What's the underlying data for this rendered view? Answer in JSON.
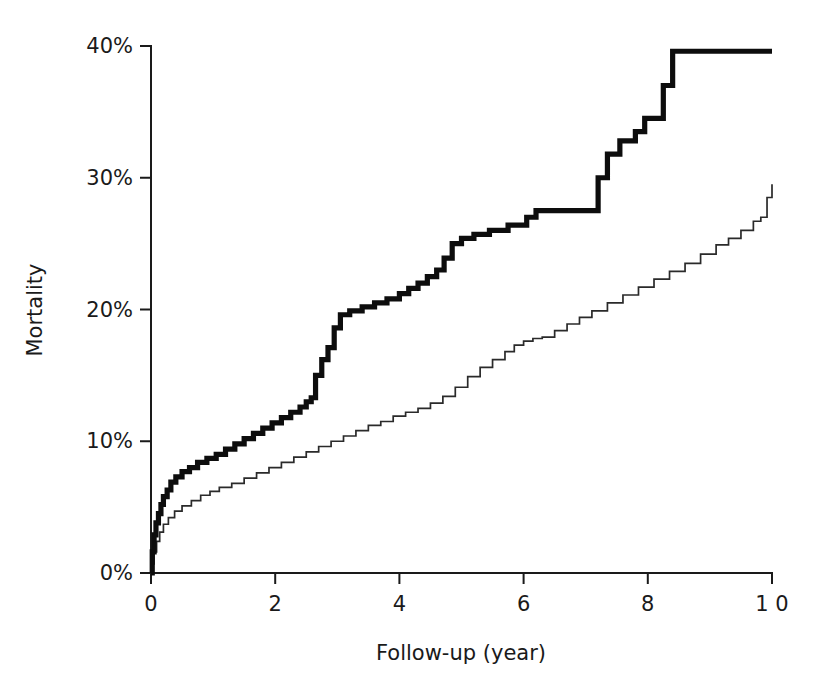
{
  "chart_data": {
    "type": "line",
    "title": "",
    "subtitle": "",
    "xlabel": "Follow-up (year)",
    "ylabel": "Mortality",
    "xlim": [
      0,
      10
    ],
    "ylim": [
      0,
      40
    ],
    "grid": false,
    "legend": "none",
    "x_ticks": [
      0,
      2,
      4,
      6,
      8,
      10
    ],
    "x_tick_labels": [
      "0",
      "2",
      "4",
      "6",
      "8",
      "1 0"
    ],
    "y_ticks": [
      0,
      10,
      20,
      30,
      40
    ],
    "y_tick_labels": [
      "0%",
      "10%",
      "20%",
      "30%",
      "40%"
    ],
    "y_unit": "%",
    "step_style": "post",
    "series": [
      {
        "name": "thick-curve",
        "style": "thick-black-step",
        "x": [
          0,
          0.02,
          0.05,
          0.08,
          0.12,
          0.16,
          0.2,
          0.26,
          0.32,
          0.4,
          0.5,
          0.62,
          0.75,
          0.9,
          1.05,
          1.2,
          1.35,
          1.5,
          1.65,
          1.8,
          1.95,
          2.1,
          2.25,
          2.4,
          2.5,
          2.58,
          2.65,
          2.75,
          2.85,
          2.95,
          3.05,
          3.2,
          3.4,
          3.6,
          3.8,
          4.0,
          4.15,
          4.3,
          4.45,
          4.6,
          4.72,
          4.85,
          5.0,
          5.2,
          5.45,
          5.75,
          6.05,
          6.2,
          7.1,
          7.2,
          7.35,
          7.55,
          7.8,
          7.95,
          8.25,
          8.4,
          10.0
        ],
        "y": [
          0.0,
          1.6,
          2.9,
          3.8,
          4.5,
          5.2,
          5.8,
          6.3,
          6.9,
          7.3,
          7.7,
          8.0,
          8.4,
          8.7,
          9.0,
          9.4,
          9.8,
          10.2,
          10.6,
          11.0,
          11.4,
          11.8,
          12.2,
          12.6,
          13.0,
          13.3,
          15.0,
          16.2,
          17.1,
          18.6,
          19.6,
          19.9,
          20.2,
          20.5,
          20.8,
          21.2,
          21.6,
          22.0,
          22.5,
          23.0,
          23.9,
          25.0,
          25.4,
          25.7,
          26.0,
          26.4,
          27.0,
          27.5,
          27.5,
          30.0,
          31.8,
          32.8,
          33.5,
          34.5,
          37.0,
          39.6,
          39.6
        ]
      },
      {
        "name": "thin-curve",
        "style": "thin-black-step",
        "x": [
          0,
          0.02,
          0.05,
          0.09,
          0.14,
          0.2,
          0.28,
          0.38,
          0.5,
          0.65,
          0.8,
          0.95,
          1.1,
          1.3,
          1.5,
          1.7,
          1.9,
          2.1,
          2.3,
          2.5,
          2.7,
          2.9,
          3.1,
          3.3,
          3.5,
          3.7,
          3.9,
          4.1,
          4.3,
          4.5,
          4.7,
          4.9,
          5.1,
          5.3,
          5.5,
          5.7,
          5.85,
          6.0,
          6.15,
          6.3,
          6.5,
          6.7,
          6.9,
          7.1,
          7.35,
          7.6,
          7.85,
          8.1,
          8.35,
          8.6,
          8.85,
          9.1,
          9.3,
          9.5,
          9.7,
          9.82,
          9.92,
          10.0
        ],
        "y": [
          0.0,
          0.7,
          1.6,
          2.4,
          3.1,
          3.7,
          4.2,
          4.7,
          5.1,
          5.5,
          5.9,
          6.2,
          6.5,
          6.8,
          7.2,
          7.6,
          8.0,
          8.4,
          8.8,
          9.2,
          9.6,
          10.0,
          10.4,
          10.8,
          11.2,
          11.5,
          11.9,
          12.2,
          12.5,
          12.9,
          13.4,
          14.1,
          14.9,
          15.6,
          16.2,
          16.8,
          17.3,
          17.6,
          17.8,
          17.9,
          18.4,
          18.9,
          19.4,
          19.9,
          20.5,
          21.1,
          21.7,
          22.3,
          22.9,
          23.5,
          24.2,
          24.9,
          25.4,
          26.0,
          26.7,
          27.0,
          28.5,
          29.5
        ]
      }
    ],
    "annotations": []
  },
  "axes": {
    "x_title": "Follow-up (year)",
    "y_title": "Mortality"
  }
}
